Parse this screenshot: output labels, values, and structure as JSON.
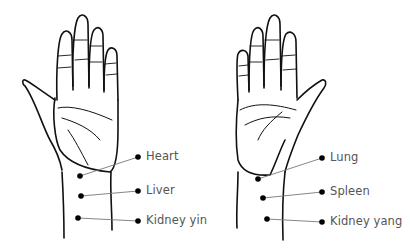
{
  "diagram": {
    "left_hand": {
      "label": "Left wrist pulse positions",
      "points": [
        {
          "name": "Heart",
          "dot": [
            80,
            176
          ],
          "end": [
            138,
            157
          ],
          "text_pos": [
            146,
            151
          ]
        },
        {
          "name": "Liver",
          "dot": [
            81,
            196
          ],
          "end": [
            138,
            191
          ],
          "text_pos": [
            146,
            185
          ]
        },
        {
          "name": "Kidney yin",
          "dot": [
            78,
            218
          ],
          "end": [
            138,
            221
          ],
          "text_pos": [
            146,
            215
          ]
        }
      ]
    },
    "right_hand": {
      "label": "Right wrist pulse positions",
      "points": [
        {
          "name": "Lung",
          "dot": [
            258,
            179
          ],
          "end": [
            322,
            158
          ],
          "text_pos": [
            330,
            152
          ]
        },
        {
          "name": "Spleen",
          "dot": [
            263,
            198
          ],
          "end": [
            322,
            192
          ],
          "text_pos": [
            330,
            186
          ]
        },
        {
          "name": "Kidney yang",
          "dot": [
            267,
            219
          ],
          "end": [
            322,
            222
          ],
          "text_pos": [
            330,
            216
          ]
        }
      ]
    },
    "colors": {
      "line": "#111111",
      "leader": "#777777",
      "dot": "#000000",
      "text": "#555555"
    }
  }
}
